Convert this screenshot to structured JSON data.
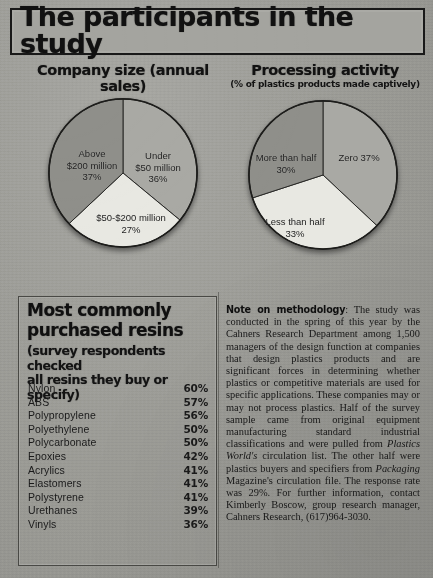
{
  "page": {
    "headline": "The participants in the study"
  },
  "charts": [
    {
      "id": "company-size",
      "title": "Company size (annual sales)",
      "subtitle": "",
      "chart_data": {
        "type": "pie",
        "title": "Company size (annual sales)",
        "categories": [
          "Under $50 million",
          "$50-$200 million",
          "Above $200 million"
        ],
        "values": [
          36,
          27,
          37
        ],
        "unit": "%",
        "start_angle_deg": 0,
        "direction": "clockwise",
        "colors": [
          "#a8a8a3",
          "#e6e6e0",
          "#8f8f8a"
        ],
        "labels": [
          {
            "text": "Under\n$50 million\n36%",
            "slice": "Under $50 million"
          },
          {
            "text": "$50-$200 million\n27%",
            "slice": "$50-$200 million"
          },
          {
            "text": "Above\n$200 million\n37%",
            "slice": "Above $200 million"
          }
        ],
        "legend": "none",
        "grid": false
      },
      "slice_labels": [
        {
          "line1": "Under",
          "line2": "$50 million",
          "line3": "36%"
        },
        {
          "line1": "$50-$200 million",
          "line2": "27%",
          "line3": ""
        },
        {
          "line1": "Above",
          "line2": "$200 million",
          "line3": "37%"
        }
      ]
    },
    {
      "id": "processing-activity",
      "title": "Processing activity",
      "subtitle": "(% of plastics products made captively)",
      "chart_data": {
        "type": "pie",
        "title": "Processing activity",
        "subtitle": "(% of plastics products made captively)",
        "categories": [
          "Zero",
          "Less than half",
          "More than half"
        ],
        "values": [
          37,
          33,
          30
        ],
        "unit": "%",
        "start_angle_deg": 0,
        "direction": "clockwise",
        "colors": [
          "#a8a8a3",
          "#e6e6e0",
          "#8f8f8a"
        ],
        "labels": [
          {
            "text": "Zero 37%",
            "slice": "Zero"
          },
          {
            "text": "Less than half\n33%",
            "slice": "Less than half"
          },
          {
            "text": "More than half\n30%",
            "slice": "More than half"
          }
        ],
        "legend": "none",
        "grid": false
      },
      "slice_labels": [
        {
          "line1": "Zero  37%",
          "line2": "",
          "line3": ""
        },
        {
          "line1": "Less than half",
          "line2": "33%",
          "line3": ""
        },
        {
          "line1": "More than half",
          "line2": "30%",
          "line3": ""
        }
      ]
    }
  ],
  "resins": {
    "heading_line1": "Most commonly",
    "heading_line2": "purchased resins",
    "subheading_line1": "(survey respondents checked",
    "subheading_line2": "all resins they buy or specify)",
    "chart_data": {
      "type": "table",
      "title": "Most commonly purchased resins",
      "subtitle": "(survey respondents checked all resins they buy or specify)",
      "columns": [
        "Resin",
        "Percent"
      ],
      "categories": [
        "Nylon",
        "ABS",
        "Polypropylene",
        "Polyethylene",
        "Polycarbonate",
        "Epoxies",
        "Acrylics",
        "Elastomers",
        "Polystyrene",
        "Urethanes",
        "Vinyls"
      ],
      "values": [
        60,
        57,
        56,
        50,
        50,
        42,
        41,
        41,
        41,
        39,
        36
      ],
      "unit": "%"
    },
    "items": [
      {
        "name": "Nylon",
        "value": "60%"
      },
      {
        "name": "ABS",
        "value": "57%"
      },
      {
        "name": "Polypropylene",
        "value": "56%"
      },
      {
        "name": "Polyethylene",
        "value": "50%"
      },
      {
        "name": "Polycarbonate",
        "value": "50%"
      },
      {
        "name": "Epoxies",
        "value": "42%"
      },
      {
        "name": "Acrylics",
        "value": "41%"
      },
      {
        "name": "Elastomers",
        "value": "41%"
      },
      {
        "name": "Polystyrene",
        "value": "41%"
      },
      {
        "name": "Urethanes",
        "value": "39%"
      },
      {
        "name": "Vinyls",
        "value": "36%"
      }
    ]
  },
  "note": {
    "lead": "Note on methodology",
    "separator": ": ",
    "part1": "The study was conducted in the spring of this year by the Cahners Research Department among 1,500 managers of the design function at companies that design plastics products and are significant forces in determining whether plastics or competitive materials are used for specific applications. These companies may or may not process plastics. Half of the survey sample came from original equipment manufacturing standard industrial classifications and were pulled from ",
    "italic1": "Plastics World's",
    "part2": " circulation list. The other half were plastics buyers and specifiers from ",
    "italic2": "Packaging",
    "part3": " Magazine's circulation file. The response rate was 29%. For further information, contact Kimberly Boscow, group research manager, Cahners Research, (617)964-3030."
  },
  "colors": {
    "paper": "#9d9d99",
    "ink": "#141414",
    "slice_light": "#e6e6e0",
    "slice_mid": "#a8a8a3",
    "slice_dark": "#8f8f8a"
  }
}
